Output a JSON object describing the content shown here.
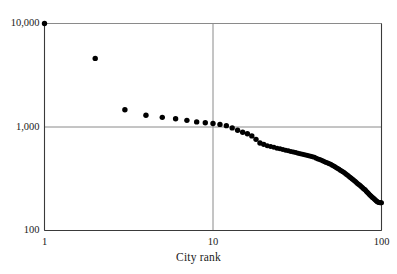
{
  "chart_data": {
    "type": "scatter",
    "title": "",
    "xlabel": "City rank",
    "ylabel": "",
    "xscale": "log",
    "yscale": "log",
    "xlim": [
      1,
      100
    ],
    "ylim": [
      100,
      10000
    ],
    "xticks": [
      1,
      10,
      100
    ],
    "xticklabels": [
      "1",
      "10",
      "100"
    ],
    "yticks": [
      100,
      1000,
      10000
    ],
    "yticklabels": [
      "100",
      "1,000",
      "10,000"
    ],
    "grid": true,
    "legend": null,
    "marker": "circle",
    "marker_color": "#000000",
    "x": [
      1,
      2,
      3,
      4,
      5,
      6,
      7,
      8,
      9,
      10,
      11,
      12,
      13,
      14,
      15,
      16,
      17,
      18,
      19,
      20,
      21,
      22,
      23,
      24,
      25,
      26,
      27,
      28,
      29,
      30,
      31,
      32,
      33,
      34,
      35,
      36,
      37,
      38,
      39,
      40,
      41,
      42,
      43,
      44,
      45,
      46,
      47,
      48,
      49,
      50,
      51,
      52,
      53,
      54,
      55,
      56,
      57,
      58,
      59,
      60,
      61,
      62,
      63,
      64,
      65,
      66,
      67,
      68,
      69,
      70,
      71,
      72,
      73,
      74,
      75,
      76,
      77,
      78,
      79,
      80,
      81,
      82,
      83,
      84,
      85,
      86,
      87,
      88,
      89,
      90,
      91,
      92,
      93,
      94,
      95,
      96,
      97,
      98,
      99,
      100
    ],
    "y": [
      10000,
      4600,
      1470,
      1300,
      1240,
      1200,
      1160,
      1120,
      1100,
      1080,
      1060,
      1030,
      980,
      930,
      890,
      860,
      820,
      760,
      700,
      680,
      660,
      648,
      636,
      625,
      615,
      606,
      597,
      589,
      581,
      573,
      566,
      559,
      552,
      545,
      539,
      533,
      527,
      521,
      515,
      509,
      500,
      492,
      484,
      476,
      469,
      462,
      455,
      448,
      442,
      436,
      428,
      420,
      412,
      404,
      397,
      390,
      383,
      376,
      370,
      364,
      356,
      348,
      341,
      334,
      327,
      321,
      315,
      309,
      303,
      297,
      291,
      285,
      280,
      275,
      270,
      265,
      260,
      255,
      251,
      247,
      241,
      236,
      231,
      226,
      222,
      218,
      214,
      210,
      207,
      204,
      200,
      197,
      194,
      191,
      189,
      187,
      186,
      185,
      185,
      185
    ],
    "series_name": "City population by rank",
    "annotations": []
  },
  "figure": {
    "top_cropped_text": "",
    "x_axis_title": "City rank"
  },
  "colors": {
    "axis": "#3a3a3a",
    "grid": "#8a8a8a",
    "marker": "#000000",
    "background": "#ffffff"
  }
}
